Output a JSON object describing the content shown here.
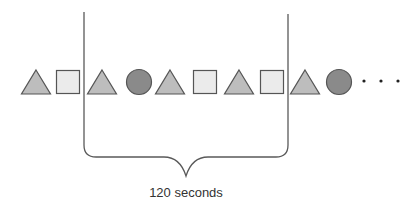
{
  "diagram": {
    "colors": {
      "triangle_fill": "#bdbdbd",
      "square_fill": "#ebebeb",
      "circle_fill": "#8a8a8a",
      "stroke": "#555555",
      "line": "#5a5a5a",
      "text": "#333333"
    },
    "sequence": [
      {
        "shape": "triangle",
        "cx": 36
      },
      {
        "shape": "square",
        "cx": 68
      },
      {
        "shape": "triangle",
        "cx": 102
      },
      {
        "shape": "circle",
        "cx": 139
      },
      {
        "shape": "triangle",
        "cx": 170
      },
      {
        "shape": "square",
        "cx": 205
      },
      {
        "shape": "triangle",
        "cx": 239
      },
      {
        "shape": "square",
        "cx": 272
      },
      {
        "shape": "triangle",
        "cx": 305
      },
      {
        "shape": "circle",
        "cx": 339
      }
    ],
    "continuation": "· · ·",
    "window": {
      "left_x": 84,
      "right_x": 288,
      "top_y": 12,
      "bottom_y": 157,
      "tip_x": 186,
      "tip_y": 176
    },
    "window_label": "120 seconds"
  }
}
